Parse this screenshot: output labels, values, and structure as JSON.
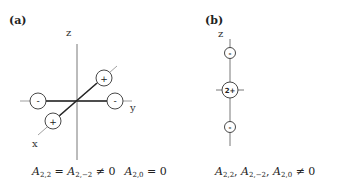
{
  "panels": [
    {
      "label": "(a)",
      "axes": {
        "z": "z",
        "y": "y",
        "x": "x"
      },
      "charges": {
        "left_y": "-",
        "right_y": "-",
        "upper_x": "+",
        "lower_x": "+"
      },
      "equation": {
        "part1_sym": "A",
        "part1_sub": "2,2",
        "part1_eq": " = ",
        "part2_sym": "A",
        "part2_sub": "2,−2",
        "part2_neq": " ≠ 0",
        "part3_sym": "A",
        "part3_sub": "2,0",
        "part3_eq": " = 0"
      }
    },
    {
      "label": "(b)",
      "axes": {
        "z": "z"
      },
      "charges": {
        "top": "-",
        "center": "2+",
        "bottom": "-"
      },
      "equation": {
        "p1_sym": "A",
        "p1_sub": "2,2",
        "sep1": ", ",
        "p2_sym": "A",
        "p2_sub": "2,−2",
        "sep2": ", ",
        "p3_sym": "A",
        "p3_sub": "2,0",
        "tail": " ≠ 0"
      }
    }
  ],
  "colors": {
    "line": "#333333",
    "axis_light": "#888888",
    "background": "#ffffff"
  }
}
